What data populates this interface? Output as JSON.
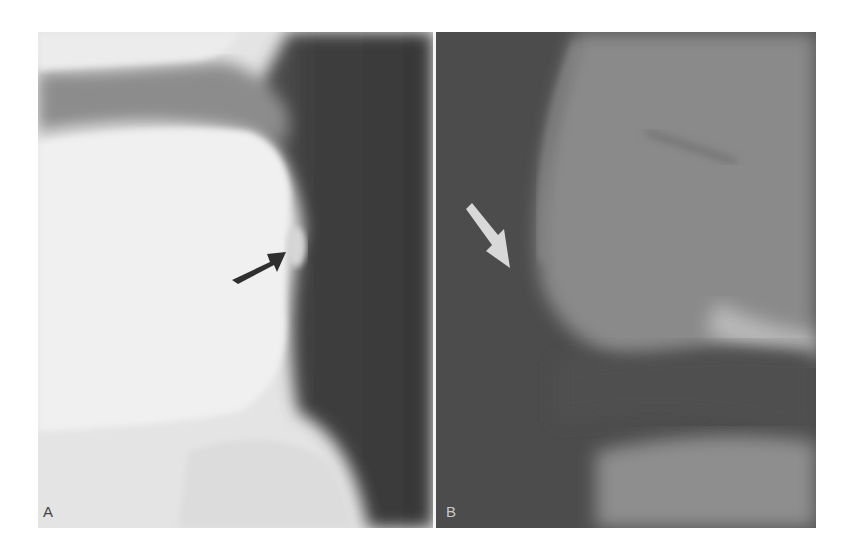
{
  "figure": {
    "panels": [
      {
        "id": "A",
        "label": "A",
        "description": "Lateral radiograph: bright vertebral body on left, dark soft tissue band on right",
        "arrow": {
          "color": "#333333",
          "direction": "up-right"
        }
      },
      {
        "id": "B",
        "label": "B",
        "description": "Lateral radiograph: dark region on left with grey bony structure on right",
        "arrow": {
          "color": "#dcdcdc",
          "direction": "down-right"
        }
      }
    ],
    "colors": {
      "background": "#ffffff",
      "divider": "#f4f4f4",
      "panel_a_bone": "#e6e6e6",
      "panel_a_soft_tissue": "#3c3c3c",
      "panel_b_dark": "#4a4a4a",
      "panel_b_bone": "#8c8c8c"
    }
  }
}
